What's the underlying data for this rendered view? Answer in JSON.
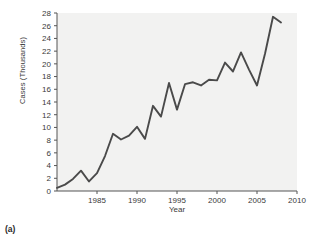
{
  "figure": {
    "caption": "(a)"
  },
  "chart_data": {
    "type": "line",
    "title": "",
    "subtitle": "",
    "xlabel": "Year",
    "ylabel": "Cases (Thousands)",
    "xlim": [
      1980,
      2010
    ],
    "ylim": [
      0,
      28
    ],
    "xticks": [
      1985,
      1990,
      1995,
      2000,
      2005,
      2010
    ],
    "xtick_labels": [
      "1985",
      "1990",
      "1995",
      "2000",
      "2005",
      "2010"
    ],
    "yticks": [
      0,
      2,
      4,
      6,
      8,
      10,
      12,
      14,
      16,
      18,
      20,
      22,
      24,
      26,
      28
    ],
    "ytick_labels": [
      "0",
      "2",
      "4",
      "6",
      "8",
      "10",
      "12",
      "14",
      "16",
      "18",
      "20",
      "22",
      "24",
      "26",
      "28"
    ],
    "grid": false,
    "legend": null,
    "series": [
      {
        "name": "Cases",
        "color": "#4a4a4a",
        "x": [
          1980,
          1981,
          1982,
          1983,
          1984,
          1985,
          1986,
          1987,
          1988,
          1989,
          1990,
          1991,
          1992,
          1993,
          1994,
          1995,
          1996,
          1997,
          1998,
          1999,
          2000,
          2001,
          2002,
          2003,
          2004,
          2005,
          2006,
          2007,
          2008
        ],
        "values": [
          0.5,
          1.0,
          1.9,
          3.2,
          1.5,
          2.8,
          5.5,
          9.0,
          8.1,
          8.7,
          10.1,
          8.2,
          13.4,
          11.7,
          17.0,
          12.8,
          16.8,
          17.1,
          16.6,
          17.5,
          17.4,
          20.2,
          18.8,
          21.8,
          19.1,
          16.6,
          21.6,
          27.4,
          26.5
        ]
      }
    ]
  },
  "colors": {
    "line": "#4a4a4a",
    "axis": "#555555",
    "plot_background": "#f2f2f1",
    "text": "#3a3a3a"
  }
}
